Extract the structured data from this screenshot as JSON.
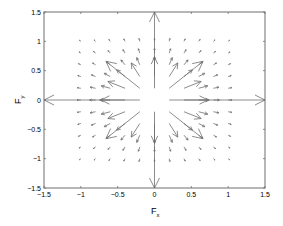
{
  "chart_data": {
    "type": "quiver",
    "title": "",
    "xlabel": "F",
    "xlabel_subscript": "x",
    "ylabel": "F",
    "ylabel_subscript": "y",
    "xlim": [
      -1.5,
      1.5
    ],
    "ylim": [
      -1.5,
      1.5
    ],
    "xticks": [
      -1.5,
      -1,
      -0.5,
      0,
      0.5,
      1,
      1.5
    ],
    "yticks": [
      -1.5,
      -1,
      -0.5,
      0,
      0.5,
      1,
      1.5
    ],
    "xtick_labels": [
      "-1.5",
      "-1",
      "-0.5",
      "0",
      "0.5",
      "1",
      "1.5"
    ],
    "ytick_labels": [
      "-1.5",
      "-1",
      "-0.5",
      "0",
      "0.5",
      "1",
      "1.5"
    ],
    "grid": false,
    "legend": null,
    "arrow_color": "#6e6e6e",
    "grid_points": {
      "x": [
        -1.0,
        -0.8,
        -0.6,
        -0.4,
        -0.2,
        0,
        0.2,
        0.4,
        0.6,
        0.8,
        1.0
      ],
      "y": [
        -1.0,
        -0.8,
        -0.6,
        -0.4,
        -0.2,
        0,
        0.2,
        0.4,
        0.6,
        0.8,
        1.0
      ]
    },
    "field": "radial outward, magnitude proportional to 1/r^2 (F = k*r_hat/r^2)",
    "scale_k": 0.052,
    "max_length": 1.32,
    "highlighted_vectors": [
      {
        "x": -0.2,
        "y": 0,
        "u": -1.3,
        "v": 0
      },
      {
        "x": 0.2,
        "y": 0,
        "u": 1.3,
        "v": 0
      },
      {
        "x": 0,
        "y": 0.2,
        "u": 0,
        "v": 1.3
      },
      {
        "x": 0,
        "y": -0.2,
        "u": 0,
        "v": -1.3
      },
      {
        "x": -0.2,
        "y": 0.2,
        "u": -0.33,
        "v": 0.33
      },
      {
        "x": 0.2,
        "y": 0.2,
        "u": 0.33,
        "v": 0.33
      },
      {
        "x": -0.2,
        "y": -0.2,
        "u": -0.33,
        "v": -0.33
      },
      {
        "x": 0.2,
        "y": -0.2,
        "u": 0.33,
        "v": -0.33
      }
    ]
  }
}
